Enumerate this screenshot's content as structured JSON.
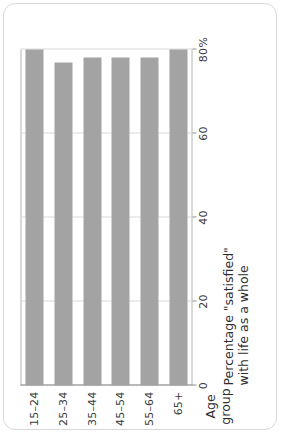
{
  "chart_data": {
    "type": "bar",
    "orientation": "horizontal",
    "title": "",
    "categories": [
      "15–24",
      "25–34",
      "35–44",
      "45–54",
      "55–64",
      "65+"
    ],
    "values": [
      80,
      77,
      78,
      78,
      78,
      80
    ],
    "xlabel": "Percentage \"satisfied\" with life as a whole",
    "ylabel": "Age group",
    "xlim": [
      0,
      80
    ],
    "ylim": null,
    "ticks": [
      "0",
      "20",
      "40",
      "60",
      "80%"
    ],
    "tick_values": [
      0,
      20,
      40,
      60,
      80
    ],
    "grid": true,
    "legend": null,
    "series": [
      {
        "name": "Percentage satisfied",
        "values": [
          80,
          77,
          78,
          78,
          78,
          80
        ]
      }
    ],
    "bar_color": "#a3a3a3",
    "gridline_color": "#d9d9d9",
    "axis_color": "#b4b4b4"
  },
  "axes": {
    "category_axis_title": "Age group",
    "value_axis_title_line1": "Percentage \"satisfied\"",
    "value_axis_title_line2": "with life as a whole"
  }
}
